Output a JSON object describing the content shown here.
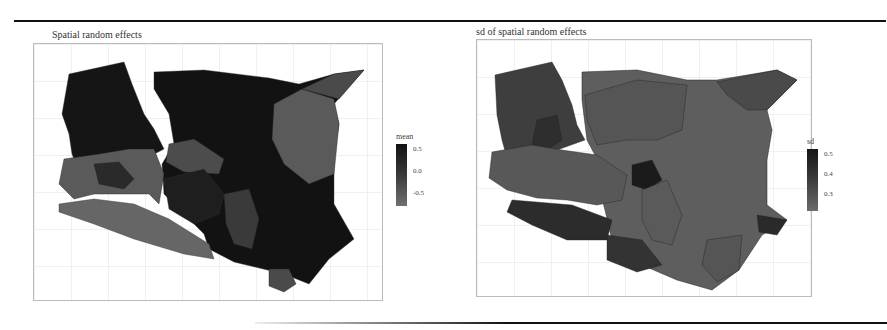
{
  "figure": {
    "panels": [
      {
        "title": "Spatial random effects",
        "legend": {
          "title": "mean",
          "ticks": [
            "0.5",
            "0.0",
            "-0.5"
          ],
          "color_high": "#111111",
          "color_low": "#6e6e6e"
        }
      },
      {
        "title": "sd of spatial random effects",
        "legend": {
          "title": "sd",
          "ticks": [
            "0.5",
            "0.4",
            "0.3"
          ],
          "color_high": "#151515",
          "color_low": "#6a6a6a"
        }
      }
    ]
  },
  "colors": {
    "rule": "#111111",
    "frame": "#bbbbbb",
    "grid": "#f0f0f0"
  }
}
